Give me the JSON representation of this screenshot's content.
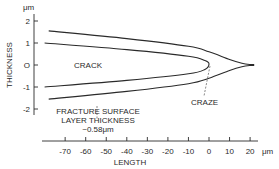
{
  "diagram": {
    "type": "crack-craze profile",
    "y_axis": {
      "label": "THICKNESS",
      "unit": "μm",
      "ticks": [
        "2",
        "1",
        "O",
        "-1",
        "-2"
      ],
      "tick_values": [
        2,
        1,
        0,
        -1,
        -2
      ],
      "range": [
        -2,
        2
      ]
    },
    "x_axis": {
      "label": "LENGTH",
      "unit": "μm",
      "ticks": [
        "-70",
        "-60",
        "-50",
        "-40",
        "-30",
        "-20",
        "-10",
        "0",
        "10",
        "20"
      ],
      "tick_values": [
        -70,
        -60,
        -50,
        -40,
        -30,
        -20,
        -10,
        0,
        10,
        20
      ],
      "range": [
        -75,
        25
      ]
    },
    "annotations": {
      "crack": "CRACK",
      "craze": "CRAZE",
      "fracture_line1": "FRACTURE SURFACE",
      "fracture_line2": "LAYER THICKNESS",
      "fracture_line3": "~0.58μm"
    },
    "curves": {
      "outer_upper": [
        [
          -78,
          1.55
        ],
        [
          -40,
          1.2
        ],
        [
          -10,
          0.85
        ],
        [
          0,
          0.6
        ],
        [
          10,
          0.25
        ],
        [
          16,
          0.08
        ],
        [
          20,
          0.02
        ],
        [
          22,
          0.02
        ]
      ],
      "outer_lower": [
        [
          -78,
          -1.55
        ],
        [
          -40,
          -1.2
        ],
        [
          -10,
          -0.85
        ],
        [
          0,
          -0.6
        ],
        [
          10,
          -0.25
        ],
        [
          16,
          -0.08
        ],
        [
          20,
          -0.02
        ],
        [
          22,
          -0.02
        ]
      ],
      "inner_upper": [
        [
          -80,
          1.0
        ],
        [
          -40,
          0.7
        ],
        [
          -10,
          0.4
        ],
        [
          -2,
          0.2
        ],
        [
          0,
          0.05
        ]
      ],
      "inner_lower": [
        [
          -80,
          -1.0
        ],
        [
          -40,
          -0.7
        ],
        [
          -10,
          -0.4
        ],
        [
          -2,
          -0.2
        ],
        [
          0,
          0.05
        ]
      ]
    }
  }
}
